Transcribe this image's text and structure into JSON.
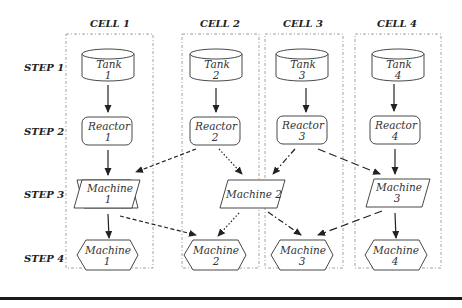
{
  "cells": [
    {
      "label": "CELL 1"
    },
    {
      "label": "CELL 2"
    },
    {
      "label": "CELL 3"
    },
    {
      "label": "CELL 4"
    }
  ],
  "steps": [
    {
      "label": "STEP 1"
    },
    {
      "label": "STEP 2"
    },
    {
      "label": "STEP 3"
    },
    {
      "label": "STEP 4"
    }
  ],
  "nodes": {
    "tank1": {
      "line1": "Tank",
      "line2": "1",
      "shape": "cylinder"
    },
    "tank2": {
      "line1": "Tank",
      "line2": "2",
      "shape": "cylinder"
    },
    "tank3": {
      "line1": "Tank",
      "line2": "3",
      "shape": "cylinder"
    },
    "tank4": {
      "line1": "Tank",
      "line2": "4",
      "shape": "cylinder"
    },
    "reactor1": {
      "line1": "Reactor",
      "line2": "1",
      "shape": "rounded-rect"
    },
    "reactor2": {
      "line1": "Reactor",
      "line2": "2",
      "shape": "rounded-rect"
    },
    "reactor3": {
      "line1": "Reactor",
      "line2": "3",
      "shape": "rounded-rect"
    },
    "reactor4": {
      "line1": "Reactor",
      "line2": "4",
      "shape": "rounded-rect"
    },
    "machine1_s3": {
      "line1": "Machine",
      "line2": "1",
      "shape": "parallelogram"
    },
    "machine2_s3": {
      "line1": "Machine 2",
      "line2": "",
      "shape": "parallelogram"
    },
    "machine3_s3": {
      "line1": "Machine",
      "line2": "3",
      "shape": "parallelogram"
    },
    "machine1_s4": {
      "line1": "Machine",
      "line2": "1",
      "shape": "hexagon"
    },
    "machine2_s4": {
      "line1": "Machine",
      "line2": "2",
      "shape": "hexagon"
    },
    "machine3_s4": {
      "line1": "Machine",
      "line2": "3",
      "shape": "hexagon"
    },
    "machine4_s4": {
      "line1": "Machine",
      "line2": "4",
      "shape": "hexagon"
    }
  },
  "edges": [
    {
      "from": "Tank 1",
      "to": "Reactor 1",
      "style": "solid"
    },
    {
      "from": "Tank 2",
      "to": "Reactor 2",
      "style": "solid"
    },
    {
      "from": "Tank 3",
      "to": "Reactor 3",
      "style": "solid"
    },
    {
      "from": "Tank 4",
      "to": "Reactor 4",
      "style": "solid"
    },
    {
      "from": "Reactor 1",
      "to": "Machine 1 (step 3)",
      "style": "solid"
    },
    {
      "from": "Reactor 2",
      "to": "Machine 1 (step 3)",
      "style": "dashed"
    },
    {
      "from": "Reactor 2",
      "to": "Machine 2 (step 3)",
      "style": "dotted"
    },
    {
      "from": "Reactor 3",
      "to": "Machine 2 (step 3)",
      "style": "dash-dot"
    },
    {
      "from": "Reactor 3",
      "to": "Machine 3 (step 3)",
      "style": "long-dash"
    },
    {
      "from": "Reactor 4",
      "to": "Machine 3 (step 3)",
      "style": "solid"
    },
    {
      "from": "Machine 1 (step 3)",
      "to": "Machine 1 (step 4)",
      "style": "solid"
    },
    {
      "from": "Machine 1 (step 3)",
      "to": "Machine 2 (step 4)",
      "style": "dashed"
    },
    {
      "from": "Machine 2 (step 3)",
      "to": "Machine 2 (step 4)",
      "style": "dotted"
    },
    {
      "from": "Machine 2 (step 3)",
      "to": "Machine 3 (step 4)",
      "style": "dash-dot"
    },
    {
      "from": "Machine 3 (step 3)",
      "to": "Machine 3 (step 4)",
      "style": "long-dash"
    },
    {
      "from": "Machine 3 (step 3)",
      "to": "Machine 4 (step 4)",
      "style": "solid"
    }
  ]
}
